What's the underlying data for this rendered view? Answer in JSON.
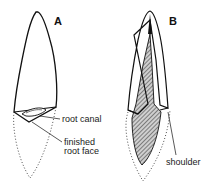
{
  "figure": {
    "panels": [
      {
        "id": "A",
        "label": "A",
        "annotations": [
          "root canal",
          "finished",
          "root face"
        ]
      },
      {
        "id": "B",
        "label": "B",
        "annotations": [
          "shoulder"
        ]
      }
    ]
  },
  "colors": {
    "line": "#111111",
    "hatch": "#555555",
    "background": "#ffffff"
  }
}
